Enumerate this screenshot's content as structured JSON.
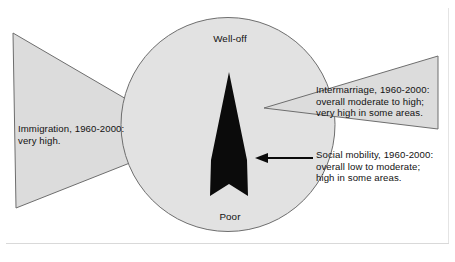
{
  "figure": {
    "title_visible": false,
    "width": 455,
    "height": 262,
    "background_color": "#ffffff",
    "frame_color": "#d9d9d9",
    "shape_fill": "#dcdcdc",
    "shape_stroke": "#6e6e6e",
    "arrow_color": "#000000",
    "text_color": "#121212"
  },
  "circle": {
    "name": "society-circle",
    "top_label": "Well-off",
    "bottom_label": "Poor",
    "center_x": 228,
    "center_y": 124,
    "radius": 107
  },
  "wedges": {
    "left": {
      "name": "immigration-wedge",
      "direction": "points-right",
      "label": "Immigration, 1960-2000:\nvery high."
    },
    "right": {
      "name": "intermarriage-wedge",
      "direction": "points-left",
      "label": "Intermarriage, 1960-2000:\noverall moderate to high;\nvery high in some areas."
    }
  },
  "arrows": {
    "vertical": {
      "name": "social-mobility-arrow",
      "direction": "up",
      "color": "#000000"
    },
    "pointer": {
      "name": "callout-pointer-arrow",
      "direction": "left",
      "color": "#000000"
    }
  },
  "callout": {
    "name": "social-mobility-callout",
    "label": "Social mobility, 1960-2000:\noverall low to moderate;\nhigh in some areas."
  }
}
